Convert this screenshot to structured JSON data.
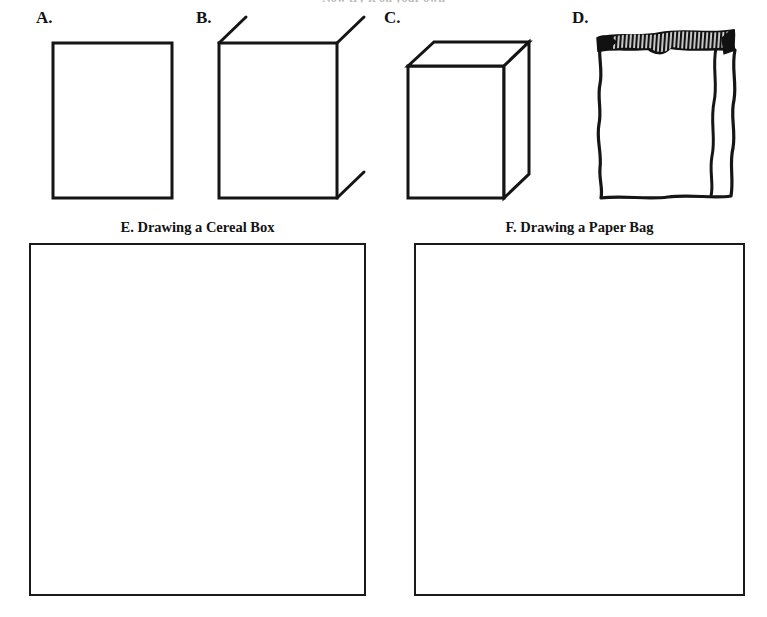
{
  "worksheet": {
    "top_instruction": "Now try it on your own",
    "background_color": "#ffffff",
    "ink_color": "#131313"
  },
  "steps": [
    {
      "label": "A.",
      "name": "step-a-rectangle",
      "description": "plain upright rectangle outline"
    },
    {
      "label": "B.",
      "name": "step-b-rectangle-with-guides",
      "description": "rectangle with three short diagonal guide lines at corners"
    },
    {
      "label": "C.",
      "name": "step-c-finished-box",
      "description": "completed three dimensional cereal box"
    },
    {
      "label": "D.",
      "name": "step-d-paper-bag",
      "description": "crumpled paper bag with dark crimped top edge"
    }
  ],
  "panels": [
    {
      "caption": "E. Drawing a Cereal Box",
      "name": "drawing-area-cereal-box",
      "contents": ""
    },
    {
      "caption": "F. Drawing a Paper Bag",
      "name": "drawing-area-paper-bag",
      "contents": ""
    }
  ]
}
